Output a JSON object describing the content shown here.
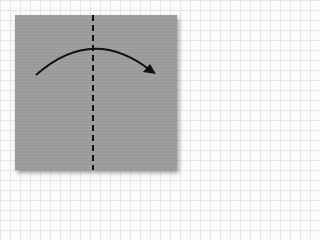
{
  "diagram": {
    "type": "origami-fold-step",
    "paper": {
      "shape": "square",
      "color": "#9a9a9a"
    },
    "background": {
      "pattern": "grid",
      "color": "#fbfbfb",
      "grid_color": "#e6e6e6"
    },
    "fold_line": {
      "style": "dashed",
      "orientation": "vertical",
      "position": "center",
      "color": "#111111"
    },
    "arrow": {
      "direction": "left-to-right",
      "shape": "arc",
      "color": "#111111",
      "meaning": "fold left half over to the right"
    }
  }
}
